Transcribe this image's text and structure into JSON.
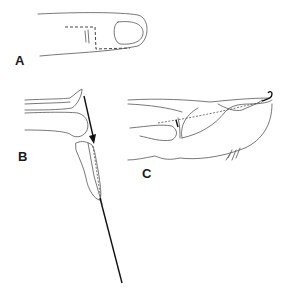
{
  "figure": {
    "panels": [
      {
        "id": "A",
        "label": "A",
        "description": "Dorsal view of fingertip with dashed incision outline near nail"
      },
      {
        "id": "B",
        "label": "B",
        "description": "Lateral view with flap reflected and arrow indicating needle/wire direction through distal phalanx"
      },
      {
        "id": "C",
        "label": "C",
        "description": "Lateral view of finger with dashed wire path along phalanges ending in hooked tip"
      }
    ],
    "colors": {
      "line": "#555555",
      "wire": "#111111",
      "background": "#ffffff"
    }
  }
}
